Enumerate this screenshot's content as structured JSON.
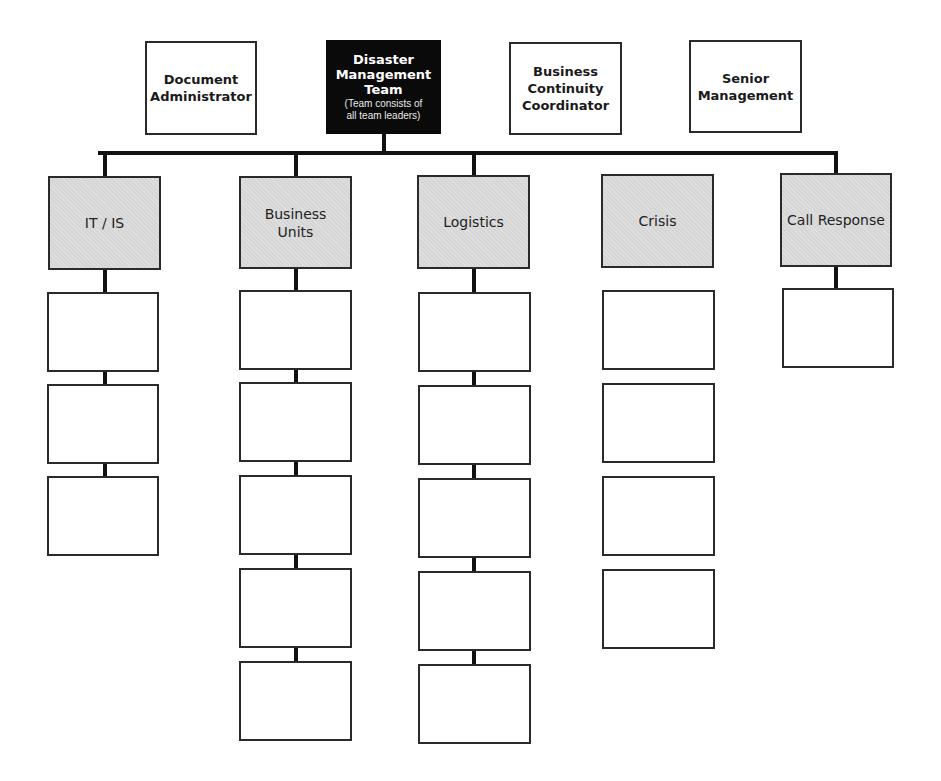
{
  "top_row": [
    {
      "id": "document-administrator",
      "label": "Document\nAdministrator",
      "x": 145,
      "y": 41,
      "w": 112,
      "h": 94
    },
    {
      "id": "disaster-management-team",
      "label": "Disaster\nManagement\nTeam",
      "sublabel": "(Team consists of\nall team leaders)",
      "x": 326,
      "y": 40,
      "w": 115,
      "h": 94
    },
    {
      "id": "business-continuity-coordinator",
      "label": "Business\nContinuity\nCoordinator",
      "x": 509,
      "y": 42,
      "w": 113,
      "h": 93
    },
    {
      "id": "senior-management",
      "label": "Senior\nManagement",
      "x": 689,
      "y": 40,
      "w": 113,
      "h": 93
    }
  ],
  "bus": {
    "y": 151,
    "x1": 98,
    "x2": 835,
    "thickness": 4,
    "stem_x": 382
  },
  "teams": [
    {
      "id": "it-is",
      "label": "IT / IS",
      "x": 48,
      "y": 176,
      "w": 113,
      "h": 94,
      "connected": true,
      "children": [
        {
          "y": 292,
          "h": 80
        },
        {
          "y": 384,
          "h": 80
        },
        {
          "y": 476,
          "h": 80
        }
      ],
      "child_x": 47,
      "child_w": 112
    },
    {
      "id": "business-units",
      "label": "Business\nUnits",
      "x": 239,
      "y": 176,
      "w": 113,
      "h": 93,
      "connected": true,
      "children": [
        {
          "y": 290,
          "h": 80
        },
        {
          "y": 382,
          "h": 80
        },
        {
          "y": 475,
          "h": 80
        },
        {
          "y": 568,
          "h": 80
        }
      ],
      "child_x": 239,
      "child_w": 113
    },
    {
      "id": "logistics",
      "label": "Logistics",
      "x": 417,
      "y": 175,
      "w": 113,
      "h": 94,
      "connected": true,
      "children": [
        {
          "y": 292,
          "h": 80
        },
        {
          "y": 385,
          "h": 80
        },
        {
          "y": 478,
          "h": 80
        },
        {
          "y": 571,
          "h": 80
        }
      ],
      "child_x": 418,
      "child_w": 113
    },
    {
      "id": "crisis",
      "label": "Crisis",
      "x": 601,
      "y": 174,
      "w": 113,
      "h": 94,
      "connected": false,
      "children": [
        {
          "y": 290,
          "h": 80
        },
        {
          "y": 383,
          "h": 80
        },
        {
          "y": 476,
          "h": 80
        },
        {
          "y": 569,
          "h": 80
        }
      ],
      "child_x": 602,
      "child_w": 113
    },
    {
      "id": "call-response",
      "label": "Call Response",
      "x": 780,
      "y": 173,
      "w": 112,
      "h": 94,
      "connected": true,
      "children": [
        {
          "y": 288,
          "h": 80
        }
      ],
      "child_x": 782,
      "child_w": 112
    }
  ],
  "extra_child_business_units": {
    "y": 661,
    "h": 80
  },
  "extra_child_logistics": {
    "y": 664,
    "h": 80
  },
  "colors": {
    "line": "#111111",
    "dark_box": "#0a0a0a",
    "team_fill": "#d6d6d6",
    "border": "#2a2a2a"
  }
}
